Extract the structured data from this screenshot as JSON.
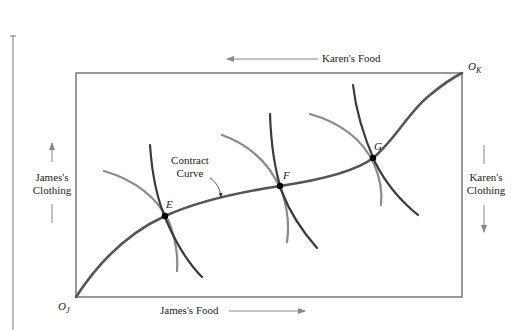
{
  "diagram": {
    "type": "edgeworth-box",
    "title": "",
    "colors": {
      "box": "#555555",
      "contract_curve": "#555555",
      "james_indifference": "#8a8a8a",
      "karen_indifference": "#3a3a3a",
      "point": "#000000",
      "arrow": "#888888"
    },
    "axes": {
      "top": {
        "label": "Karen's Food",
        "direction": "left"
      },
      "bottom": {
        "label": "James's Food",
        "direction": "right"
      },
      "left": {
        "label_line1": "James's",
        "label_line2": "Clothing",
        "direction": "up"
      },
      "right": {
        "label_line1": "Karen's",
        "label_line2": "Clothing",
        "direction": "down"
      }
    },
    "origins": {
      "james": {
        "letter": "O",
        "sub": "J"
      },
      "karen": {
        "letter": "O",
        "sub": "K"
      }
    },
    "points": [
      {
        "id": "E",
        "label": "E",
        "x": 165,
        "y": 216
      },
      {
        "id": "F",
        "label": "F",
        "x": 280,
        "y": 186
      },
      {
        "id": "G",
        "label": "G",
        "x": 373,
        "y": 158
      }
    ],
    "annotation": {
      "line1": "Contract",
      "line2": "Curve"
    }
  }
}
